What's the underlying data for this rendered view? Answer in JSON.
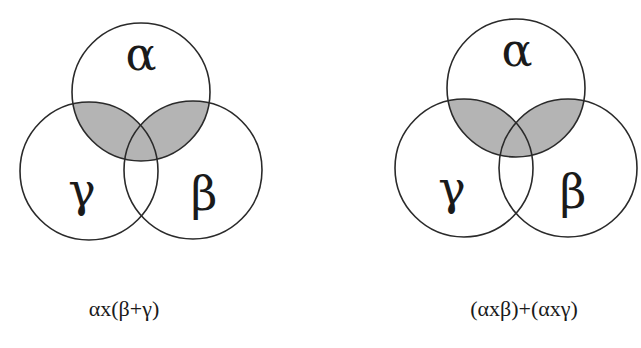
{
  "diagrams": [
    {
      "id": "left",
      "formula": "αx(β+γ)",
      "circles": {
        "alpha": {
          "label": "α",
          "cx": 141,
          "cy": 92,
          "r": 69
        },
        "gamma": {
          "label": "γ",
          "cx": 89,
          "cy": 171,
          "r": 69
        },
        "beta": {
          "label": "β",
          "cx": 193,
          "cy": 170,
          "r": 69
        }
      },
      "shaded_region": "α ∩ (β ∪ γ)"
    },
    {
      "id": "right",
      "formula": "(αxβ)+(αxγ)",
      "circles": {
        "alpha": {
          "label": "α",
          "cx": 516,
          "cy": 88,
          "r": 69
        },
        "gamma": {
          "label": "γ",
          "cx": 464,
          "cy": 168,
          "r": 69
        },
        "beta": {
          "label": "β",
          "cx": 568,
          "cy": 168,
          "r": 69
        }
      },
      "shaded_region": "(α ∩ β) ∪ (α ∩ γ)"
    }
  ],
  "colors": {
    "shade": "#b4b4b4",
    "stroke": "#2a2a2a",
    "background": "#ffffff"
  }
}
